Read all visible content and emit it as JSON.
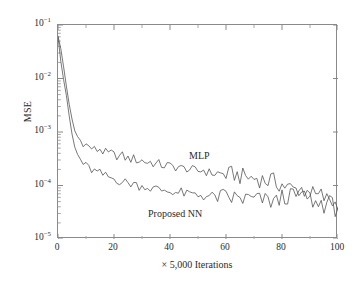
{
  "chart_data": {
    "type": "line",
    "title": "",
    "xlabel": "× 5,000 Iterations",
    "ylabel": "MSE",
    "yscale": "log",
    "xlim": [
      0,
      100
    ],
    "ylim": [
      1e-05,
      0.1
    ],
    "grid": false,
    "legend_position": "inline-annotation",
    "xticks": [
      0,
      20,
      40,
      60,
      80,
      100
    ],
    "xtick_labels": [
      "0",
      "20",
      "40",
      "60",
      "80",
      "100"
    ],
    "ytick_labels": [
      "10⁻¹",
      "10⁻²",
      "10⁻³",
      "10⁻⁴",
      "10⁻⁵"
    ],
    "ytick_values": [
      0.1,
      0.01,
      0.001,
      0.0001,
      1e-05
    ],
    "annotations": [
      {
        "text": "MLP",
        "x": 47,
        "y": 0.00027
      },
      {
        "text": "Proposed NN",
        "x": 33,
        "y": 7.2e-05
      }
    ],
    "series": [
      {
        "name": "MLP",
        "color": "#555555",
        "x": [
          0,
          1,
          2,
          3,
          4,
          5,
          6,
          7,
          8,
          9,
          10,
          11,
          12,
          13,
          14,
          15,
          16,
          17,
          18,
          19,
          20,
          21,
          22,
          23,
          24,
          25,
          26,
          27,
          28,
          29,
          30,
          31,
          32,
          33,
          34,
          35,
          36,
          37,
          38,
          39,
          40,
          41,
          42,
          43,
          44,
          45,
          46,
          47,
          48,
          49,
          50,
          51,
          52,
          53,
          54,
          55,
          56,
          57,
          58,
          59,
          60,
          61,
          62,
          63,
          64,
          65,
          66,
          67,
          68,
          69,
          70,
          71,
          72,
          73,
          74,
          75,
          76,
          77,
          78,
          79,
          80,
          81,
          82,
          83,
          84,
          85,
          86,
          87,
          88,
          89,
          90,
          91,
          92,
          93,
          94,
          95,
          96,
          97,
          98,
          99,
          100
        ],
        "values": [
          0.062,
          0.036,
          0.0165,
          0.0072,
          0.0033,
          0.00175,
          0.00105,
          0.00082,
          0.0007,
          0.00064,
          0.00058,
          0.00053,
          0.0005,
          0.00047,
          0.00046,
          0.00049,
          0.00043,
          0.00041,
          0.00039,
          0.0004,
          0.00037,
          0.00036,
          0.00035,
          0.00036,
          0.00033,
          0.00032,
          0.00031,
          0.00032,
          0.0003,
          0.00029,
          0.000295,
          0.00028,
          0.00027,
          0.000275,
          0.00026,
          0.00025,
          0.000255,
          0.00024,
          0.000235,
          0.00024,
          0.00023,
          0.000225,
          0.00022,
          0.000225,
          0.00021,
          0.000205,
          0.00021,
          0.0002,
          0.000195,
          0.00019,
          0.000185,
          0.00019,
          0.000195,
          0.00018,
          0.000175,
          0.00017,
          0.000175,
          0.000165,
          0.00016,
          0.000165,
          0.00016,
          0.000155,
          0.00016,
          0.000165,
          0.000155,
          0.00015,
          0.000145,
          0.00015,
          0.000142,
          0.000138,
          0.000135,
          0.00014,
          0.000132,
          0.000128,
          0.000125,
          0.000122,
          0.000128,
          0.000118,
          0.000112,
          0.000108,
          0.000105,
          9.8e-05,
          9.2e-05,
          8.8e-05,
          8.5e-05,
          8.2e-05,
          8.6e-05,
          7.8e-05,
          7.4e-05,
          7.2e-05,
          7.6e-05,
          6.8e-05,
          6.4e-05,
          6.2e-05,
          6.6e-05,
          5.8e-05,
          5.4e-05,
          5.7e-05,
          5e-05,
          4.6e-05,
          5e-05
        ]
      },
      {
        "name": "Proposed NN",
        "color": "#555555",
        "x": [
          0,
          1,
          2,
          3,
          4,
          5,
          6,
          7,
          8,
          9,
          10,
          11,
          12,
          13,
          14,
          15,
          16,
          17,
          18,
          19,
          20,
          21,
          22,
          23,
          24,
          25,
          26,
          27,
          28,
          29,
          30,
          31,
          32,
          33,
          34,
          35,
          36,
          37,
          38,
          39,
          40,
          41,
          42,
          43,
          44,
          45,
          46,
          47,
          48,
          49,
          50,
          51,
          52,
          53,
          54,
          55,
          56,
          57,
          58,
          59,
          60,
          61,
          62,
          63,
          64,
          65,
          66,
          67,
          68,
          69,
          70,
          71,
          72,
          73,
          74,
          75,
          76,
          77,
          78,
          79,
          80,
          81,
          82,
          83,
          84,
          85,
          86,
          87,
          88,
          89,
          90,
          91,
          92,
          93,
          94,
          95,
          96,
          97,
          98,
          99,
          100
        ],
        "values": [
          0.06,
          0.021,
          0.0095,
          0.0048,
          0.002,
          0.00092,
          0.00052,
          0.00038,
          0.00031,
          0.00026,
          0.00023,
          0.00021,
          0.000195,
          0.000185,
          0.000175,
          0.000168,
          0.000158,
          0.00015,
          0.000145,
          0.000138,
          0.000132,
          0.000128,
          0.000122,
          0.000118,
          0.000115,
          0.00011,
          0.000108,
          0.000112,
          0.000102,
          9.8e-05,
          9.5e-05,
          0.0001,
          9.2e-05,
          8.8e-05,
          8.6e-05,
          9e-05,
          8.2e-05,
          8e-05,
          8.4e-05,
          7.8e-05,
          7.6e-05,
          7.9e-05,
          7.4e-05,
          7.2e-05,
          7.6e-05,
          7e-05,
          6.8e-05,
          7.2e-05,
          6.6e-05,
          6.9e-05,
          6.4e-05,
          6.7e-05,
          6.2e-05,
          6.5e-05,
          6.1e-05,
          6.4e-05,
          6e-05,
          6.3e-05,
          5.9e-05,
          6.2e-05,
          5.8e-05,
          6.1e-05,
          5.7e-05,
          6e-05,
          5.6e-05,
          5.9e-05,
          5.5e-05,
          5.8e-05,
          5.4e-05,
          5.7e-05,
          5.3e-05,
          5.6e-05,
          5.2e-05,
          5.5e-05,
          5.1e-05,
          5.4e-05,
          5e-05,
          5.3e-05,
          4.9e-05,
          5.2e-05,
          6.2e-05,
          5.8e-05,
          6.5e-05,
          6e-05,
          6.8e-05,
          6.2e-05,
          7e-05,
          6.4e-05,
          7.2e-05,
          6.6e-05,
          5.8e-05,
          5.2e-05,
          4.6e-05,
          4.2e-05,
          4.8e-05,
          4.4e-05,
          5e-05,
          4.6e-05,
          4.2e-05,
          3.8e-05,
          4.4e-05
        ]
      }
    ]
  }
}
